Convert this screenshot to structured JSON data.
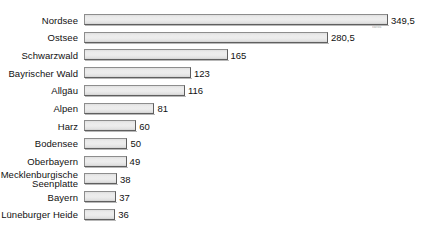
{
  "chart_data": {
    "type": "bar",
    "orientation": "horizontal",
    "title": "",
    "subtitle": "",
    "xlabel": "",
    "ylabel": "",
    "grid": false,
    "legend": null,
    "axis_visible": false,
    "value_label_decimal_separator": ",",
    "xlim": [
      0,
      349.5
    ],
    "categories": [
      "Nordsee",
      "Ostsee",
      "Schwarzwald",
      "Bayrischer Wald",
      "Allgäu",
      "Alpen",
      "Harz",
      "Bodensee",
      "Oberbayern",
      "Mecklenburgische\nSeenplatte",
      "Bayern",
      "Lüneburger Heide"
    ],
    "values": [
      349.5,
      280.5,
      165,
      123,
      116,
      81,
      60,
      50,
      49,
      38,
      37,
      36
    ],
    "value_labels": [
      "349,5",
      "280,5",
      "165",
      "123",
      "116",
      "81",
      "60",
      "50",
      "49",
      "38",
      "37",
      "36"
    ],
    "colors": {
      "bar_fill_light": "#ededed",
      "bar_fill_dark": "#d2d2d2",
      "bar_border_light": "#8d8d8d",
      "bar_border_dark": "#5f5f5f",
      "text": "#111111",
      "background": "#ffffff",
      "watermark": "#9a9a9a"
    }
  },
  "watermark": {
    "text": "statista"
  }
}
